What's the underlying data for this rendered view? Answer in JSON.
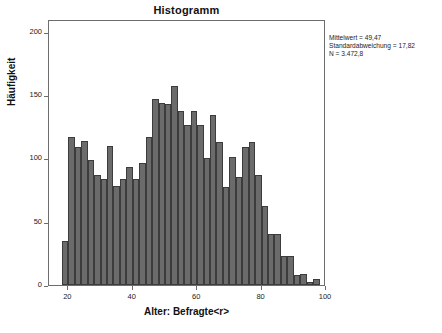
{
  "chart_data": {
    "type": "bar",
    "title": "Histogramm",
    "xlabel": "Alter: Befragte<r>",
    "ylabel": "Häufigkeit",
    "xlim": [
      14,
      100
    ],
    "ylim": [
      0,
      210
    ],
    "grid": false,
    "legend": null,
    "bin_width": 2,
    "x_ticks": [
      20,
      40,
      60,
      80,
      100
    ],
    "y_ticks": [
      0,
      50,
      100,
      150,
      200
    ],
    "bar_color": "#6b6b6b",
    "bar_edge_color": "#3c3c3c",
    "annotations": [
      "Mittelwert = 49,47",
      "Standardabweichung = 17,82",
      "N = 3.472,8"
    ],
    "categories": [
      18,
      20,
      22,
      24,
      26,
      28,
      30,
      32,
      34,
      36,
      38,
      40,
      42,
      44,
      46,
      48,
      50,
      52,
      54,
      56,
      58,
      60,
      62,
      64,
      66,
      68,
      70,
      72,
      74,
      76,
      78,
      80,
      82,
      84,
      86,
      88,
      90,
      92,
      94,
      96
    ],
    "values": [
      35,
      117,
      109,
      114,
      99,
      87,
      84,
      110,
      78,
      84,
      93,
      84,
      96,
      117,
      147,
      144,
      143,
      157,
      137,
      126,
      137,
      126,
      100,
      134,
      113,
      77,
      101,
      85,
      109,
      113,
      87,
      62,
      40,
      40,
      23,
      23,
      8,
      9,
      2,
      5
    ]
  },
  "stats": {
    "mean_label": "Mittelwert = 49,47",
    "sd_label": "Standardabweichung = 17,82",
    "n_label": "N = 3.472,8"
  },
  "axes": {
    "y_tick_labels": [
      "0",
      "50",
      "100",
      "150",
      "200"
    ],
    "x_tick_labels": [
      "20",
      "40",
      "60",
      "80",
      "100"
    ]
  }
}
